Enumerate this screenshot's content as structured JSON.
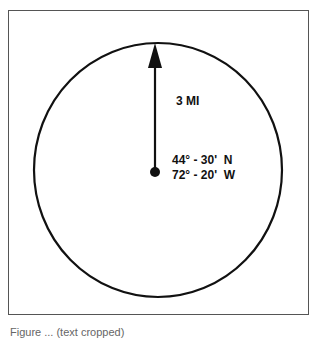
{
  "diagram": {
    "radius_label": "3 MI",
    "center": {
      "latitude": "44° - 30'  N",
      "longitude": "72° - 20'  W"
    },
    "caption": "Figure ... (text cropped)"
  },
  "colors": {
    "stroke": "#111111",
    "frame": "#555555",
    "background": "#ffffff"
  }
}
